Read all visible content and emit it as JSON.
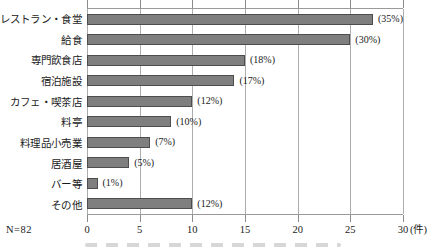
{
  "chart_data": {
    "type": "bar",
    "orientation": "horizontal",
    "title": "",
    "categories": [
      "レストラン・食堂",
      "給食",
      "専門飲食店",
      "宿泊施設",
      "カフェ・喫茶店",
      "料亭",
      "料理品小売業",
      "居酒屋",
      "バー等",
      "その他"
    ],
    "values": [
      29,
      25,
      15,
      14,
      10,
      8,
      6,
      4,
      1,
      10
    ],
    "value_labels": [
      "(35%)",
      "(30%)",
      "(18%)",
      "(17%)",
      "(12%)",
      "(10%)",
      "(7%)",
      "(5%)",
      "(1%)",
      "(12%)"
    ],
    "x_ticks": [
      0,
      5,
      10,
      15,
      20,
      25,
      30
    ],
    "xlim": [
      0,
      30
    ],
    "axis_unit": "(件)",
    "n_label": "N=82",
    "grid": true,
    "legend": "none",
    "colors": {
      "bar_fill": "#7f7f7f",
      "bar_border": "#4d4d4d",
      "gridline": "#adadad",
      "tick": "#8c8c8c",
      "text": "#1a1a1a"
    }
  }
}
